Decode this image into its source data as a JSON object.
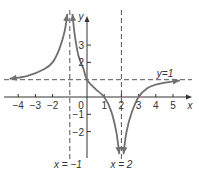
{
  "chart_data": {
    "type": "line",
    "title": "",
    "xlabel": "x",
    "ylabel": "y",
    "xlim": [
      -4.2,
      5.6
    ],
    "ylim": [
      -2.9,
      4.6
    ],
    "x_ticks": [
      "-4",
      "-3",
      "-2",
      "0",
      "1",
      "2",
      "3",
      "4",
      "5"
    ],
    "y_ticks": [
      "-2",
      "-1",
      "2",
      "3"
    ],
    "grid": false,
    "asymptotes": {
      "vertical": [
        {
          "x": -1,
          "label": "x = −1"
        },
        {
          "x": 2,
          "label": "x = 2"
        }
      ],
      "horizontal": [
        {
          "y": 1,
          "label": "y = 1"
        }
      ]
    },
    "series": [
      {
        "name": "branch-left",
        "points": [
          [
            -4.5,
            1.05
          ],
          [
            -3.5,
            1.2
          ],
          [
            -2.5,
            1.6
          ],
          [
            -2,
            2.0
          ],
          [
            -1.6,
            2.8
          ],
          [
            -1.3,
            3.8
          ],
          [
            -1.15,
            4.8
          ]
        ]
      },
      {
        "name": "branch-middle",
        "points": [
          [
            -0.85,
            4.8
          ],
          [
            -0.7,
            3.5
          ],
          [
            -0.5,
            2.4
          ],
          [
            -0.2,
            1.6
          ],
          [
            0,
            1.0
          ],
          [
            0.5,
            0.45
          ],
          [
            1,
            0
          ],
          [
            1.4,
            -0.8
          ],
          [
            1.7,
            -2.0
          ],
          [
            1.88,
            -3.3
          ]
        ]
      },
      {
        "name": "branch-right",
        "points": [
          [
            2.12,
            -3.3
          ],
          [
            2.3,
            -2.0
          ],
          [
            2.6,
            -0.9
          ],
          [
            3,
            0
          ],
          [
            3.5,
            0.5
          ],
          [
            4,
            0.72
          ],
          [
            5,
            0.9
          ],
          [
            5.4,
            0.95
          ]
        ]
      }
    ],
    "curve_color": "#707070",
    "axis_color": "#333333"
  }
}
